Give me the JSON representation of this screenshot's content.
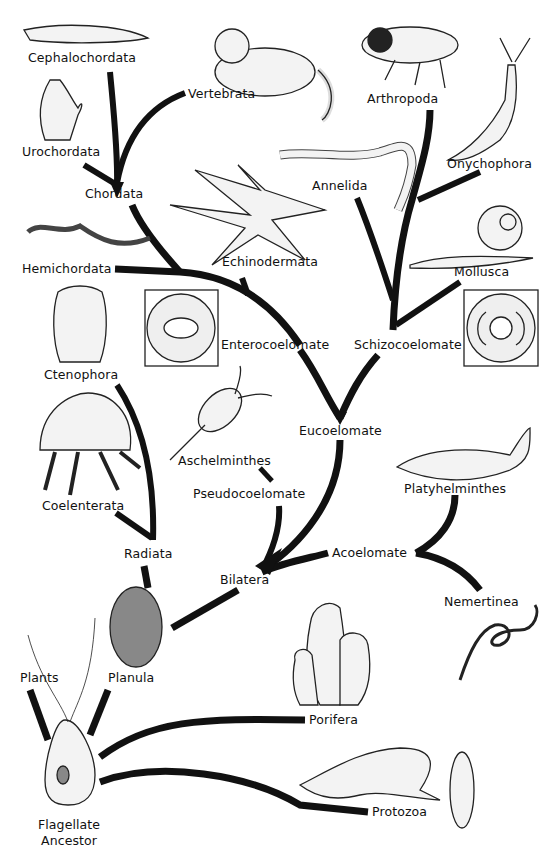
{
  "diagram": {
    "type": "phylogenetic-tree",
    "root": "Flagellate Ancestor",
    "colors": {
      "branch": "#111111",
      "background": "#ffffff",
      "text": "#111111"
    }
  },
  "labels": {
    "cephalochordata": "Cephalochordata",
    "vertebrata": "Vertebrata",
    "urochordata": "Urochordata",
    "chordata": "Chordata",
    "arthropoda": "Arthropoda",
    "onychophora": "Onychophora",
    "annelida": "Annelida",
    "hemichordata": "Hemichordata",
    "echinodermata": "Echinodermata",
    "mollusca": "Mollusca",
    "enterocoelomate": "Enterocoelomate",
    "schizocoelomate": "Schizocoelomate",
    "ctenophora": "Ctenophora",
    "eucoelomate": "Eucoelomate",
    "aschelminthes": "Aschelminthes",
    "pseudocoelomate": "Pseudocoelomate",
    "platyhelminthes": "Platyhelminthes",
    "coelenterata": "Coelenterata",
    "radiata": "Radiata",
    "acoelomate": "Acoelomate",
    "bilatera": "Bilatera",
    "nemertinea": "Nemertinea",
    "plants": "Plants",
    "planula": "Planula",
    "porifera": "Porifera",
    "flagellate_ancestor": "Flagellate\nAncestor",
    "protozoa": "Protozoa"
  },
  "tree": {
    "Flagellate Ancestor": [
      "Plants",
      "Planula",
      "Porifera",
      "Protozoa"
    ],
    "Planula": [
      "Radiata",
      "Bilatera"
    ],
    "Radiata": [
      "Ctenophora",
      "Coelenterata"
    ],
    "Bilatera": [
      "Acoelomate",
      "Pseudocoelomate",
      "Eucoelomate"
    ],
    "Acoelomate": [
      "Platyhelminthes",
      "Nemertinea"
    ],
    "Pseudocoelomate": [
      "Aschelminthes"
    ],
    "Eucoelomate": [
      "Enterocoelomate",
      "Schizocoelomate"
    ],
    "Enterocoelomate": [
      "Hemichordata",
      "Echinodermata",
      "Chordata"
    ],
    "Chordata": [
      "Cephalochordata",
      "Urochordata",
      "Vertebrata"
    ],
    "Schizocoelomate": [
      "Annelida",
      "Mollusca",
      "Arthropoda",
      "Onychophora"
    ]
  },
  "illustrations": [
    "lancelet",
    "cat",
    "tunicate",
    "cicada",
    "velvet-worm",
    "earthworm",
    "acorn-worm",
    "starfish",
    "snail",
    "enterocoel-cross-section",
    "comb-jelly",
    "schizocoel-cross-section",
    "rotifer",
    "flatworm",
    "jellyfish",
    "ribbon-worm",
    "planula-larva",
    "sponge",
    "flagellate",
    "amoeba",
    "paramecium"
  ]
}
